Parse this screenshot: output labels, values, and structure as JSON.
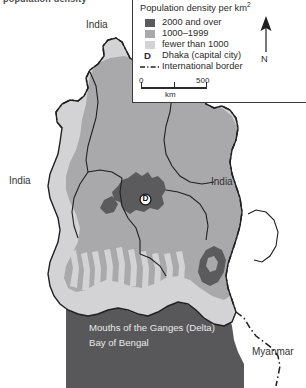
{
  "figure": {
    "cropped_caption_sliver": "population density"
  },
  "legend": {
    "title": "Population density per km",
    "title_superscript": "2",
    "classes": [
      {
        "label": "2000 and over",
        "color": "#5b5b5d",
        "swatch": "density-high-swatch"
      },
      {
        "label": "1000–1999",
        "color": "#a9a9ab",
        "swatch": "density-mid-swatch"
      },
      {
        "label": "fewer than 1000",
        "color": "#d3d3d5",
        "swatch": "density-low-swatch"
      }
    ],
    "capital": {
      "key": "D",
      "label": "Dhaka (capital city)"
    },
    "border": {
      "label": "International border",
      "style": "dash-dot"
    },
    "scalebar": {
      "start": "0",
      "end": "500",
      "unit": "km"
    },
    "north_arrow": {
      "label": "N"
    }
  },
  "map": {
    "country": "Bangladesh",
    "labels": [
      {
        "name": "india-north",
        "text": "India",
        "x": 86,
        "y": 25
      },
      {
        "name": "india-west",
        "text": "India",
        "x": 9,
        "y": 181
      },
      {
        "name": "india-east",
        "text": "India",
        "x": 211,
        "y": 182
      },
      {
        "name": "myanmar",
        "text": "Myanmar",
        "x": 252,
        "y": 352
      }
    ],
    "sea_labels": [
      {
        "name": "ganges-delta",
        "text": "Mouths of the Ganges (Delta)",
        "x": 89,
        "y": 329
      },
      {
        "name": "bay-of-bengal",
        "text": "Bay of Bengal",
        "x": 89,
        "y": 344
      }
    ],
    "dhaka": {
      "key": "D",
      "x": 139,
      "y": 192
    },
    "colors": {
      "sea": "#58585a",
      "land_outside": "#ffffff",
      "density_high": "#5b5b5d",
      "density_mid": "#a9a9ab",
      "density_low": "#d3d3d5",
      "boundary": "#1f1f1f"
    }
  }
}
